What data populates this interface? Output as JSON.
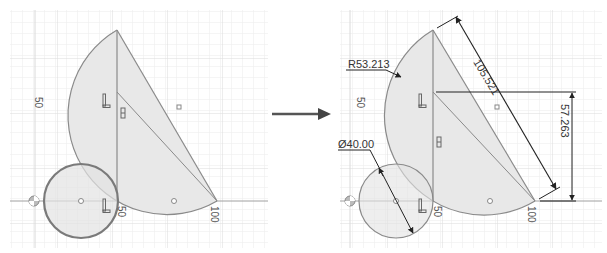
{
  "left_panel": {
    "axis_labels": {
      "y_50": "50",
      "x_50": "50",
      "x_100": "100"
    }
  },
  "transition_arrow": {
    "direction": "right"
  },
  "right_panel": {
    "axis_labels": {
      "y_50": "50",
      "x_50": "50",
      "x_100": "100"
    },
    "dimensions": {
      "arc_radius": "R53.213",
      "circle_diameter": "Ø40.00",
      "hypotenuse_length": "105.521",
      "vertical_height": "57.263"
    }
  },
  "colors": {
    "grid_minor": "#ececec",
    "grid_major": "#d9d9d9",
    "sketch_line": "#8a8a8a",
    "profile_fill": "#e6e6e6",
    "circle_selected": "#7a7a7a",
    "dimension_line": "#333333",
    "axis": "#9a9a9a"
  }
}
